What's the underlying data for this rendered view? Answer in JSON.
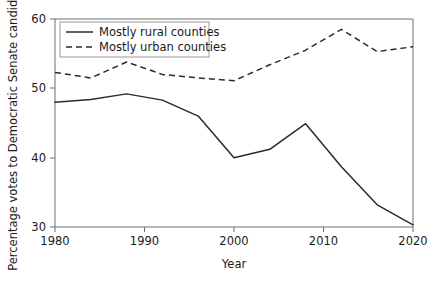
{
  "chart_data": {
    "type": "line",
    "title": "",
    "xlabel": "Year",
    "ylabel": "Percentage votes to Democratic Senate candidates",
    "xlim": [
      1980,
      2020
    ],
    "ylim": [
      30,
      60
    ],
    "xticks": [
      1980,
      1990,
      2000,
      2010,
      2020
    ],
    "xtick_labels": [
      "1980",
      "1990",
      "2000",
      "2010",
      "2020"
    ],
    "yticks": [
      30,
      40,
      50,
      60
    ],
    "ytick_labels": [
      "30",
      "40",
      "50",
      "60"
    ],
    "grid": false,
    "legend_position": "top-left",
    "x": [
      1980,
      1984,
      1988,
      1992,
      1996,
      2000,
      2004,
      2008,
      2012,
      2016,
      2020
    ],
    "series": [
      {
        "name": "Mostly rural counties",
        "style": "solid",
        "color": "#2b2b2b",
        "values": [
          48.0,
          48.4,
          49.2,
          48.3,
          46.0,
          40.0,
          41.2,
          44.9,
          38.7,
          33.2,
          30.3
        ]
      },
      {
        "name": "Mostly urban counties",
        "style": "dashed",
        "color": "#2b2b2b",
        "values": [
          52.3,
          51.5,
          53.8,
          52.0,
          51.5,
          51.1,
          53.4,
          55.5,
          58.5,
          55.3,
          56.0
        ]
      }
    ]
  },
  "legend": {
    "entries": [
      {
        "label": "Mostly rural counties",
        "style": "solid"
      },
      {
        "label": "Mostly urban counties",
        "style": "dashed"
      }
    ]
  },
  "axes": {
    "x_title": "Year",
    "y_title": "Percentage votes to Democratic Senate candidates",
    "x_tick_0": "1980",
    "x_tick_1": "1990",
    "x_tick_2": "2000",
    "x_tick_3": "2010",
    "x_tick_4": "2020",
    "y_tick_0": "30",
    "y_tick_1": "40",
    "y_tick_2": "50",
    "y_tick_3": "60"
  }
}
